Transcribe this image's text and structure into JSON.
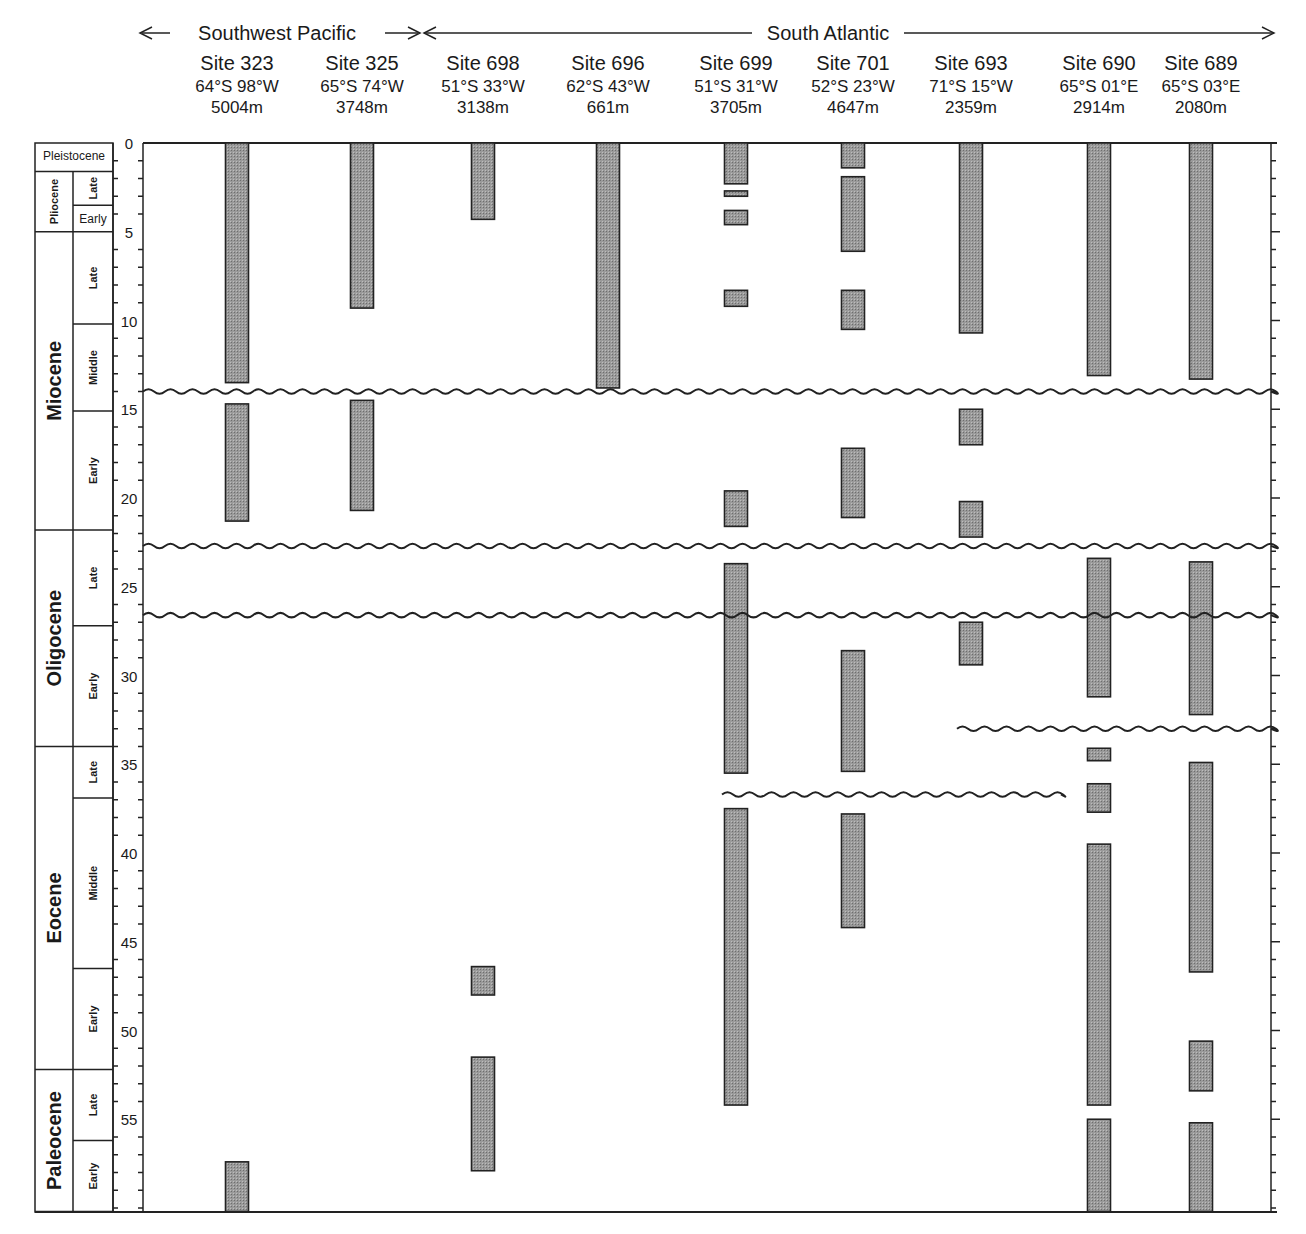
{
  "chart_data": {
    "type": "range-bar (stratigraphic occurrence chart)",
    "title": "",
    "ylabel": "Age (Ma)",
    "ylim": [
      0,
      60
    ],
    "y_axis_inverted": true,
    "y_ticks": [
      0,
      5,
      10,
      15,
      20,
      25,
      30,
      35,
      40,
      45,
      50,
      55
    ],
    "minor_tick_interval": 1,
    "regions": [
      {
        "name": "Southwest Pacific",
        "sites": [
          "Site 323",
          "Site 325"
        ]
      },
      {
        "name": "South Atlantic",
        "sites": [
          "Site 698",
          "Site 696",
          "Site 699",
          "Site 701",
          "Site 693",
          "Site 690",
          "Site 689"
        ]
      }
    ],
    "sites": [
      {
        "name": "Site 323",
        "coords": "64°S 98°W",
        "depth": "5004m",
        "intervals": [
          [
            0,
            13.5
          ],
          [
            14.7,
            21.3
          ],
          [
            57.4,
            60.2
          ]
        ]
      },
      {
        "name": "Site 325",
        "coords": "65°S 74°W",
        "depth": "3748m",
        "intervals": [
          [
            0,
            9.3
          ],
          [
            14.5,
            20.7
          ]
        ]
      },
      {
        "name": "Site 698",
        "coords": "51°S 33°W",
        "depth": "3138m",
        "intervals": [
          [
            0,
            4.3
          ],
          [
            46.4,
            48.0
          ],
          [
            51.5,
            57.9
          ]
        ]
      },
      {
        "name": "Site 696",
        "coords": "62°S 43°W",
        "depth": "661m",
        "intervals": [
          [
            0,
            13.8
          ]
        ]
      },
      {
        "name": "Site 699",
        "coords": "51°S 31°W",
        "depth": "3705m",
        "intervals": [
          [
            0,
            2.3
          ],
          [
            2.7,
            3.0
          ],
          [
            3.8,
            4.6
          ],
          [
            8.3,
            9.2
          ],
          [
            19.6,
            21.6
          ],
          [
            23.7,
            35.5
          ],
          [
            37.5,
            54.2
          ]
        ]
      },
      {
        "name": "Site 701",
        "coords": "52°S 23°W",
        "depth": "4647m",
        "intervals": [
          [
            0,
            1.4
          ],
          [
            1.9,
            6.1
          ],
          [
            8.3,
            10.5
          ],
          [
            17.2,
            21.1
          ],
          [
            28.6,
            35.4
          ],
          [
            37.8,
            44.2
          ]
        ]
      },
      {
        "name": "Site 693",
        "coords": "71°S 15°W",
        "depth": "2359m",
        "intervals": [
          [
            0,
            10.7
          ],
          [
            15.0,
            17.0
          ],
          [
            20.2,
            22.2
          ],
          [
            27.0,
            29.4
          ]
        ]
      },
      {
        "name": "Site 690",
        "coords": "65°S 01°E",
        "depth": "2914m",
        "intervals": [
          [
            0,
            13.1
          ],
          [
            23.4,
            31.2
          ],
          [
            34.1,
            34.8
          ],
          [
            36.1,
            37.7
          ],
          [
            39.5,
            54.2
          ],
          [
            55.0,
            60.2
          ]
        ]
      },
      {
        "name": "Site 689",
        "coords": "65°S 03°E",
        "depth": "2080m",
        "intervals": [
          [
            0,
            13.3
          ],
          [
            23.6,
            32.2
          ],
          [
            34.9,
            46.7
          ],
          [
            50.6,
            53.4
          ],
          [
            55.2,
            60.2
          ]
        ]
      }
    ],
    "hiatuses": [
      {
        "age": 14.0,
        "from_site": "all",
        "to_site": "all"
      },
      {
        "age": 22.7,
        "from_site": "all",
        "to_site": "all"
      },
      {
        "age": 26.6,
        "from_site": "all",
        "to_site": "all"
      },
      {
        "age": 33.0,
        "from_site": "Site 693",
        "to_site": "Site 689"
      },
      {
        "age": 36.7,
        "from_site": "Site 699",
        "to_site": "Site 693"
      }
    ],
    "epochs": [
      {
        "name": "Pleistocene",
        "start": 0,
        "end": 1.6,
        "subdivisions": []
      },
      {
        "name": "Pliocene",
        "start": 1.6,
        "end": 5.0,
        "subdivisions": [
          {
            "name": "Late",
            "start": 1.6,
            "end": 3.5
          },
          {
            "name": "Early",
            "start": 3.5,
            "end": 5.0
          }
        ]
      },
      {
        "name": "Miocene",
        "start": 5.0,
        "end": 21.8,
        "subdivisions": [
          {
            "name": "Late",
            "start": 5.0,
            "end": 10.2
          },
          {
            "name": "Middle",
            "start": 10.2,
            "end": 15.1
          },
          {
            "name": "Early",
            "start": 15.1,
            "end": 21.8
          }
        ]
      },
      {
        "name": "Oligocene",
        "start": 21.8,
        "end": 34.0,
        "subdivisions": [
          {
            "name": "Late",
            "start": 21.8,
            "end": 27.2
          },
          {
            "name": "Early",
            "start": 27.2,
            "end": 34.0
          }
        ]
      },
      {
        "name": "Eocene",
        "start": 34.0,
        "end": 52.2,
        "subdivisions": [
          {
            "name": "Late",
            "start": 34.0,
            "end": 36.9
          },
          {
            "name": "Middle",
            "start": 36.9,
            "end": 46.5
          },
          {
            "name": "Early",
            "start": 46.5,
            "end": 52.2
          }
        ]
      },
      {
        "name": "Paleocene",
        "start": 52.2,
        "end": 60.2,
        "subdivisions": [
          {
            "name": "Late",
            "start": 52.2,
            "end": 56.2
          },
          {
            "name": "Early",
            "start": 56.2,
            "end": 60.2
          }
        ]
      }
    ]
  },
  "colors": {
    "bar_fill": "#9a9a9a",
    "bar_stroke": "#222222",
    "line": "#222222",
    "background": "#ffffff"
  }
}
